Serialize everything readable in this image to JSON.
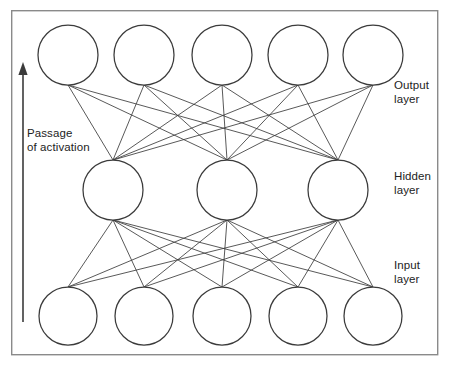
{
  "diagram": {
    "frame": {
      "x": 11,
      "y": 10,
      "width": 427,
      "height": 345
    },
    "colors": {
      "background": "#ffffff",
      "frame_stroke": "#8a8a8a",
      "node_stroke": "#3b3b3b",
      "node_fill": "#ffffff",
      "connection_stroke": "#3b3b3b",
      "text": "#232323"
    },
    "flow_arrow": {
      "label": "Passage\nof activation",
      "label_line1": "Passage",
      "label_line2": "of activation",
      "direction": "upward",
      "x": 23,
      "y_start": 322,
      "y_end": 62
    },
    "labels": {
      "output": "Output\nlayer",
      "hidden": "Hidden\nlayer",
      "input": "Input\nlayer"
    },
    "layers": [
      {
        "id": "output",
        "name": "Output layer",
        "label": "Output\nlayer",
        "node_count": 5,
        "cy": 55,
        "r": 30,
        "cx": [
          68,
          144,
          222,
          298,
          373
        ]
      },
      {
        "id": "hidden",
        "name": "Hidden layer",
        "label": "Hidden\nlayer",
        "node_count": 3,
        "cy": 190,
        "r": 30,
        "cx": [
          113,
          227,
          338
        ]
      },
      {
        "id": "input",
        "name": "Input layer",
        "label": "Input\nlayer",
        "node_count": 5,
        "cy": 316,
        "r": 29,
        "cx": [
          68,
          144,
          222,
          298,
          373
        ]
      }
    ],
    "connections": [
      {
        "from_layer": "input",
        "to_layer": "hidden",
        "fully_connected": true,
        "count": 15
      },
      {
        "from_layer": "hidden",
        "to_layer": "output",
        "fully_connected": true,
        "count": 15
      }
    ]
  }
}
